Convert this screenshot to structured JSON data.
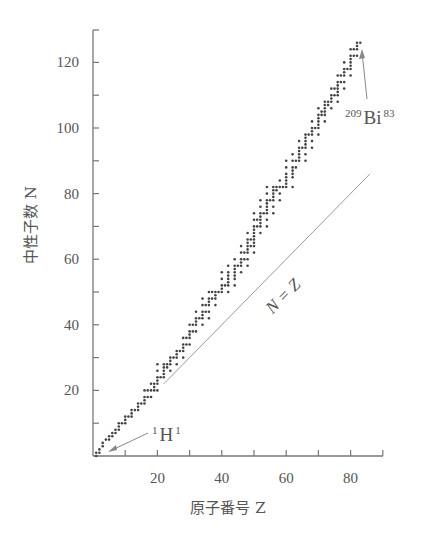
{
  "chart_data": {
    "type": "scatter",
    "title": "",
    "xlabel": "原子番号 Z",
    "ylabel": "中性子数 N",
    "xlim": [
      0,
      90
    ],
    "ylim": [
      0,
      130
    ],
    "x_ticks": [
      20,
      40,
      60,
      80
    ],
    "x_minor_ticks": [
      10,
      30,
      50,
      70,
      90
    ],
    "y_ticks": [
      20,
      40,
      60,
      80,
      100,
      120
    ],
    "y_minor_ticks": [
      10,
      30,
      50,
      70,
      90,
      110
    ],
    "grid": false,
    "legend": null,
    "reference_line": {
      "label": "N = Z",
      "from": [
        22,
        22
      ],
      "to": [
        86,
        86
      ]
    },
    "annotations": [
      {
        "text_mass": "1",
        "text_symbol": "H",
        "text_z": "1",
        "points_to": [
          1,
          0
        ]
      },
      {
        "text_mass": "209",
        "text_symbol": "Bi",
        "text_z": "83",
        "points_to": [
          83,
          126
        ]
      }
    ],
    "series": [
      {
        "name": "stable nuclides",
        "points_by_Z": {
          "1": [
            0,
            1
          ],
          "2": [
            1,
            2
          ],
          "3": [
            3,
            4
          ],
          "4": [
            5
          ],
          "5": [
            5,
            6
          ],
          "6": [
            6,
            7
          ],
          "7": [
            7,
            8
          ],
          "8": [
            8,
            9,
            10
          ],
          "9": [
            10
          ],
          "10": [
            10,
            11,
            12
          ],
          "11": [
            12
          ],
          "12": [
            12,
            13,
            14
          ],
          "13": [
            14
          ],
          "14": [
            14,
            15,
            16
          ],
          "15": [
            16
          ],
          "16": [
            16,
            17,
            18,
            20
          ],
          "17": [
            18,
            20
          ],
          "18": [
            18,
            20,
            22
          ],
          "19": [
            20,
            21,
            22
          ],
          "20": [
            20,
            22,
            23,
            24,
            26,
            28
          ],
          "21": [
            24
          ],
          "22": [
            24,
            25,
            26,
            27,
            28
          ],
          "23": [
            27,
            28
          ],
          "24": [
            26,
            28,
            29,
            30
          ],
          "25": [
            30
          ],
          "26": [
            28,
            30,
            31,
            32
          ],
          "27": [
            32
          ],
          "28": [
            30,
            32,
            33,
            34,
            36
          ],
          "29": [
            34,
            36
          ],
          "30": [
            34,
            36,
            37,
            38,
            40
          ],
          "31": [
            38,
            40
          ],
          "32": [
            38,
            40,
            41,
            42,
            44
          ],
          "33": [
            42
          ],
          "34": [
            40,
            42,
            43,
            44,
            46,
            48
          ],
          "35": [
            44,
            46
          ],
          "36": [
            42,
            44,
            46,
            47,
            48,
            50
          ],
          "37": [
            48,
            50
          ],
          "38": [
            46,
            48,
            49,
            50
          ],
          "39": [
            50
          ],
          "40": [
            50,
            51,
            52,
            54,
            56
          ],
          "41": [
            52
          ],
          "42": [
            50,
            52,
            53,
            54,
            55,
            56,
            58
          ],
          "44": [
            52,
            54,
            55,
            56,
            57,
            58,
            60
          ],
          "45": [
            58
          ],
          "46": [
            56,
            58,
            59,
            60,
            62,
            64
          ],
          "47": [
            60,
            62
          ],
          "48": [
            58,
            60,
            62,
            63,
            64,
            65,
            66,
            68
          ],
          "49": [
            64,
            66
          ],
          "50": [
            62,
            64,
            65,
            66,
            67,
            68,
            69,
            70,
            72,
            74
          ],
          "51": [
            70,
            72
          ],
          "52": [
            68,
            70,
            71,
            72,
            73,
            74,
            76,
            78
          ],
          "53": [
            74
          ],
          "54": [
            70,
            72,
            74,
            75,
            76,
            77,
            78,
            80,
            82
          ],
          "55": [
            78
          ],
          "56": [
            74,
            76,
            78,
            79,
            80,
            81,
            82
          ],
          "57": [
            81,
            82
          ],
          "58": [
            78,
            80,
            82,
            84
          ],
          "59": [
            82
          ],
          "60": [
            82,
            83,
            84,
            85,
            86,
            88,
            90
          ],
          "62": [
            82,
            85,
            86,
            87,
            88,
            90,
            92
          ],
          "63": [
            88,
            90
          ],
          "64": [
            90,
            91,
            92,
            93,
            94,
            96
          ],
          "65": [
            94
          ],
          "66": [
            90,
            92,
            94,
            95,
            96,
            97,
            98
          ],
          "67": [
            98
          ],
          "68": [
            94,
            96,
            98,
            99,
            100,
            102
          ],
          "69": [
            100
          ],
          "70": [
            98,
            100,
            101,
            102,
            103,
            104,
            106
          ],
          "71": [
            104,
            105
          ],
          "72": [
            102,
            104,
            105,
            106,
            107,
            108
          ],
          "73": [
            107,
            108
          ],
          "74": [
            106,
            108,
            109,
            110,
            112
          ],
          "75": [
            110,
            112
          ],
          "76": [
            108,
            110,
            111,
            112,
            113,
            114,
            116
          ],
          "77": [
            114,
            116
          ],
          "78": [
            112,
            114,
            116,
            117,
            118,
            120
          ],
          "79": [
            118
          ],
          "80": [
            116,
            118,
            119,
            120,
            121,
            122,
            124
          ],
          "81": [
            122,
            124
          ],
          "82": [
            122,
            124,
            125,
            126
          ],
          "83": [
            126
          ]
        }
      }
    ]
  }
}
